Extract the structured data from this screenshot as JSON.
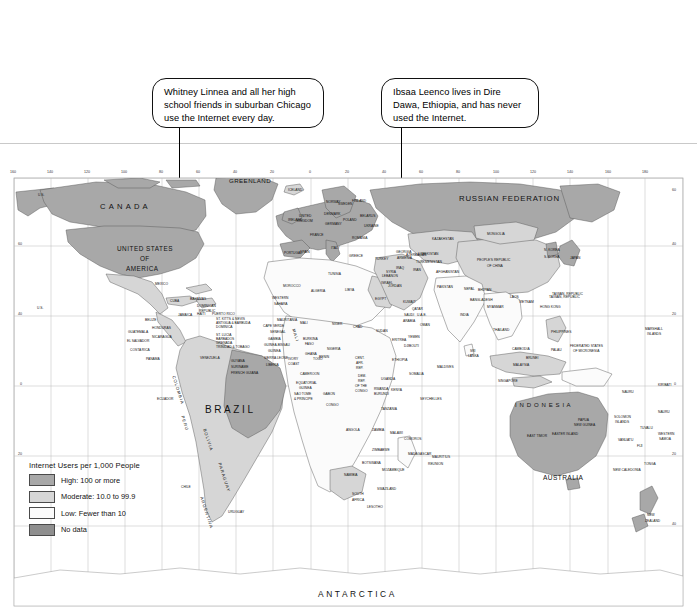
{
  "page": {
    "background_color": "#ffffff"
  },
  "callouts": [
    {
      "id": "callout-usa",
      "text": "Whitney Linnea and all her high school friends in suburban Chicago use the Internet every day.",
      "target": "United States (Chicago)"
    },
    {
      "id": "callout-ethiopia",
      "text": "Ibsaa Leenco lives in Dire Dawa, Ethiopia, and has never used the Internet.",
      "target": "Ethiopia (Dire Dawa)"
    }
  ],
  "legend": {
    "title": "Internet Users per 1,000 People",
    "items": [
      {
        "label": "High: 100 or more",
        "color": "#a8a8a8"
      },
      {
        "label": "Moderate: 10.0 to 99.9",
        "color": "#d6d6d6"
      },
      {
        "label": "Low: Fewer than 10",
        "color": "#fbfbfb"
      },
      {
        "label": "No data",
        "color": "#8f8f8f"
      }
    ]
  },
  "graticule": {
    "longitude_labels": [
      "160",
      "140",
      "120",
      "100",
      "80",
      "60",
      "40",
      "20",
      "0",
      "20",
      "40",
      "60",
      "80",
      "100",
      "120",
      "140",
      "160",
      "180"
    ],
    "latitude_labels_left": [
      "60",
      "40",
      "0",
      "20"
    ],
    "latitude_labels_right": [
      "60",
      "40",
      "20",
      "0",
      "20",
      "40"
    ]
  },
  "map_labels": {
    "continents": [
      {
        "name": "ANTARCTICA",
        "x": 355,
        "y": 594
      }
    ],
    "major": [
      {
        "name": "CANADA",
        "x": 100,
        "y": 205
      },
      {
        "name": "UNITED STATES",
        "x": 117,
        "y": 248
      },
      {
        "name": "OF",
        "x": 140,
        "y": 258
      },
      {
        "name": "AMERICA",
        "x": 126,
        "y": 268
      },
      {
        "name": "BRAZIL",
        "x": 210,
        "y": 409
      },
      {
        "name": "RUSSIAN  FEDERATION",
        "x": 470,
        "y": 198
      },
      {
        "name": "AUSTRALIA",
        "x": 551,
        "y": 477
      },
      {
        "name": "GREENLAND",
        "x": 232,
        "y": 180
      },
      {
        "name": "I N D O N E S I A",
        "x": 524,
        "y": 406
      }
    ],
    "countries": [
      {
        "name": "U.S.",
        "x": 38,
        "y": 193
      },
      {
        "name": "U.S.",
        "x": 37,
        "y": 306
      },
      {
        "name": "ICELAND",
        "x": 288,
        "y": 188
      },
      {
        "name": "MEXICO",
        "x": 155,
        "y": 282
      },
      {
        "name": "CUBA",
        "x": 170,
        "y": 299
      },
      {
        "name": "BAHAMAS",
        "x": 190,
        "y": 297
      },
      {
        "name": "BELIZE",
        "x": 145,
        "y": 318
      },
      {
        "name": "JAMAICA",
        "x": 178,
        "y": 313
      },
      {
        "name": "HAITI",
        "x": 197,
        "y": 312
      },
      {
        "name": "DOMINICAN",
        "x": 197,
        "y": 304
      },
      {
        "name": "REPUBLIC",
        "x": 199,
        "y": 309
      },
      {
        "name": "PUERTO RICO",
        "x": 212,
        "y": 312
      },
      {
        "name": "ST. KITTS & NEVIS",
        "x": 216,
        "y": 317
      },
      {
        "name": "ANTIGUA & BARBUDA",
        "x": 216,
        "y": 321
      },
      {
        "name": "DOMINICA",
        "x": 216,
        "y": 325
      },
      {
        "name": "ST. LUCIA",
        "x": 216,
        "y": 333
      },
      {
        "name": "BARBADOS",
        "x": 216,
        "y": 337
      },
      {
        "name": "GRENADA",
        "x": 216,
        "y": 341
      },
      {
        "name": "TRINIDAD & TOBAGO",
        "x": 216,
        "y": 345
      },
      {
        "name": "GUATEMALA",
        "x": 128,
        "y": 330
      },
      {
        "name": "HONDURAS",
        "x": 152,
        "y": 326
      },
      {
        "name": "EL SALVADOR",
        "x": 127,
        "y": 339
      },
      {
        "name": "NICARAGUA",
        "x": 152,
        "y": 335
      },
      {
        "name": "COSTA RICA",
        "x": 130,
        "y": 348
      },
      {
        "name": "PANAMA",
        "x": 146,
        "y": 357
      },
      {
        "name": "VENEZUELA",
        "x": 200,
        "y": 356
      },
      {
        "name": "GUYANA",
        "x": 231,
        "y": 359
      },
      {
        "name": "SURINAME",
        "x": 231,
        "y": 365
      },
      {
        "name": "FRENCH GUIANA",
        "x": 231,
        "y": 371
      },
      {
        "name": "ECUADOR",
        "x": 157,
        "y": 397
      },
      {
        "name": "CHILE",
        "x": 181,
        "y": 485
      },
      {
        "name": "URUGUAY",
        "x": 228,
        "y": 510
      },
      {
        "name": "PORTUGAL",
        "x": 284,
        "y": 251
      },
      {
        "name": "SPAIN",
        "x": 300,
        "y": 250
      },
      {
        "name": "ALGERIA",
        "x": 311,
        "y": 289
      },
      {
        "name": "LIBYA",
        "x": 345,
        "y": 288
      },
      {
        "name": "EGYPT",
        "x": 375,
        "y": 297
      },
      {
        "name": "TURKEY",
        "x": 375,
        "y": 257
      },
      {
        "name": "IRAN",
        "x": 413,
        "y": 268
      },
      {
        "name": "IRAQ",
        "x": 396,
        "y": 266
      },
      {
        "name": "SAUDI",
        "x": 404,
        "y": 313
      },
      {
        "name": "ARABIA",
        "x": 403,
        "y": 319
      },
      {
        "name": "WESTERN",
        "x": 272,
        "y": 296
      },
      {
        "name": "SAHARA",
        "x": 274,
        "y": 302
      },
      {
        "name": "MAURITANIA",
        "x": 277,
        "y": 318
      },
      {
        "name": "SENEGAL",
        "x": 270,
        "y": 330
      },
      {
        "name": "GAMBIA",
        "x": 268,
        "y": 337
      },
      {
        "name": "CAPE VERDE",
        "x": 263,
        "y": 324
      },
      {
        "name": "GUINEA-BISSAU",
        "x": 264,
        "y": 343
      },
      {
        "name": "GUINEA",
        "x": 268,
        "y": 349
      },
      {
        "name": "SIERRA LEONE",
        "x": 264,
        "y": 356
      },
      {
        "name": "LIBERIA",
        "x": 266,
        "y": 363
      },
      {
        "name": "MALI",
        "x": 300,
        "y": 321
      },
      {
        "name": "NIGER",
        "x": 332,
        "y": 322
      },
      {
        "name": "CHAD",
        "x": 353,
        "y": 325
      },
      {
        "name": "SUDAN",
        "x": 376,
        "y": 329
      },
      {
        "name": "ERITREA",
        "x": 392,
        "y": 338
      },
      {
        "name": "DJIBOUTI",
        "x": 404,
        "y": 344
      },
      {
        "name": "NIGERIA",
        "x": 327,
        "y": 347
      },
      {
        "name": "BURKINA",
        "x": 303,
        "y": 337
      },
      {
        "name": "FASO",
        "x": 305,
        "y": 342
      },
      {
        "name": "GHANA",
        "x": 305,
        "y": 352
      },
      {
        "name": "TOGO",
        "x": 313,
        "y": 357
      },
      {
        "name": "BENIN",
        "x": 319,
        "y": 355
      },
      {
        "name": "IVORY",
        "x": 288,
        "y": 357
      },
      {
        "name": "COAST",
        "x": 288,
        "y": 362
      },
      {
        "name": "CAMEROON",
        "x": 300,
        "y": 372
      },
      {
        "name": "EQUATORIAL",
        "x": 296,
        "y": 381
      },
      {
        "name": "GUINEA",
        "x": 299,
        "y": 386
      },
      {
        "name": "SAO TOME",
        "x": 294,
        "y": 392
      },
      {
        "name": "& PRINCIPE",
        "x": 294,
        "y": 397
      },
      {
        "name": "GABON",
        "x": 323,
        "y": 392
      },
      {
        "name": "CONGO",
        "x": 326,
        "y": 403
      },
      {
        "name": "CENT.",
        "x": 355,
        "y": 356
      },
      {
        "name": "AFR.",
        "x": 356,
        "y": 361
      },
      {
        "name": "REP.",
        "x": 356,
        "y": 366
      },
      {
        "name": "DEM.",
        "x": 358,
        "y": 374
      },
      {
        "name": "REP.",
        "x": 358,
        "y": 379
      },
      {
        "name": "OF THE",
        "x": 355,
        "y": 384
      },
      {
        "name": "CONGO",
        "x": 355,
        "y": 389
      },
      {
        "name": "ETHIOPIA",
        "x": 392,
        "y": 358
      },
      {
        "name": "SOMALIA",
        "x": 409,
        "y": 372
      },
      {
        "name": "UGANDA",
        "x": 381,
        "y": 377
      },
      {
        "name": "KENYA",
        "x": 391,
        "y": 388
      },
      {
        "name": "RWANDA",
        "x": 374,
        "y": 387
      },
      {
        "name": "BURUNDI",
        "x": 374,
        "y": 392
      },
      {
        "name": "TANZANIA",
        "x": 381,
        "y": 407
      },
      {
        "name": "SEYCHELLES",
        "x": 420,
        "y": 397
      },
      {
        "name": "ANGOLA",
        "x": 346,
        "y": 428
      },
      {
        "name": "ZAMBIA",
        "x": 372,
        "y": 428
      },
      {
        "name": "MALAWI",
        "x": 390,
        "y": 431
      },
      {
        "name": "MOZAMBIQUE",
        "x": 382,
        "y": 468
      },
      {
        "name": "ZIMBABWE",
        "x": 372,
        "y": 448
      },
      {
        "name": "BOTSWANA",
        "x": 362,
        "y": 461
      },
      {
        "name": "NAMIBIA",
        "x": 344,
        "y": 473
      },
      {
        "name": "SOUTH",
        "x": 352,
        "y": 492
      },
      {
        "name": "AFRICA",
        "x": 352,
        "y": 498
      },
      {
        "name": "LESOTHO",
        "x": 367,
        "y": 505
      },
      {
        "name": "SWAZILAND",
        "x": 377,
        "y": 487
      },
      {
        "name": "MADAGASCAR",
        "x": 408,
        "y": 452
      },
      {
        "name": "KAZAKHSTAN",
        "x": 432,
        "y": 237
      },
      {
        "name": "MONGOLIA",
        "x": 487,
        "y": 232
      },
      {
        "name": "PEOPLE'S REPUBLIC",
        "x": 477,
        "y": 258
      },
      {
        "name": "OF CHINA",
        "x": 487,
        "y": 264
      },
      {
        "name": "N. KOREA",
        "x": 544,
        "y": 248
      },
      {
        "name": "S. KOREA",
        "x": 544,
        "y": 255
      },
      {
        "name": "JAPAN",
        "x": 570,
        "y": 256
      },
      {
        "name": "INDIA",
        "x": 460,
        "y": 313
      },
      {
        "name": "BANGLADESH",
        "x": 470,
        "y": 298
      },
      {
        "name": "SRI",
        "x": 470,
        "y": 349
      },
      {
        "name": "LANKA",
        "x": 468,
        "y": 354
      },
      {
        "name": "MALDIVES",
        "x": 437,
        "y": 365
      },
      {
        "name": "THAILAND",
        "x": 493,
        "y": 328
      },
      {
        "name": "VIETNAM",
        "x": 519,
        "y": 300
      },
      {
        "name": "LAOS",
        "x": 510,
        "y": 295
      },
      {
        "name": "CAMBODIA",
        "x": 512,
        "y": 347
      },
      {
        "name": "MALAYSIA",
        "x": 513,
        "y": 363
      },
      {
        "name": "BRUNEI",
        "x": 526,
        "y": 356
      },
      {
        "name": "SINGAPORE",
        "x": 498,
        "y": 379
      },
      {
        "name": "PHILIPPINES",
        "x": 551,
        "y": 330
      },
      {
        "name": "HONG KONG",
        "x": 540,
        "y": 305
      },
      {
        "name": "TAIWAN, REPUBLIC",
        "x": 549,
        "y": 295
      },
      {
        "name": "TAIWAN, REPUBLIC",
        "x": 552,
        "y": 292
      },
      {
        "name": "PAPUA",
        "x": 578,
        "y": 418
      },
      {
        "name": "NEW GUINEA",
        "x": 574,
        "y": 423
      },
      {
        "name": "EAST TIMOR",
        "x": 527,
        "y": 434
      },
      {
        "name": "SOLOMON",
        "x": 614,
        "y": 415
      },
      {
        "name": "ISLANDS",
        "x": 615,
        "y": 420
      },
      {
        "name": "VANUATU",
        "x": 618,
        "y": 438
      },
      {
        "name": "FIJI",
        "x": 637,
        "y": 444
      },
      {
        "name": "TUVALU",
        "x": 640,
        "y": 426
      },
      {
        "name": "WESTERN",
        "x": 658,
        "y": 432
      },
      {
        "name": "SAMOA",
        "x": 659,
        "y": 437
      },
      {
        "name": "TONGA",
        "x": 644,
        "y": 462
      },
      {
        "name": "NEW CALEDONIA",
        "x": 613,
        "y": 468
      },
      {
        "name": "NEW",
        "x": 647,
        "y": 513
      },
      {
        "name": "ZEALAND",
        "x": 645,
        "y": 519
      },
      {
        "name": "NAURU",
        "x": 622,
        "y": 390
      },
      {
        "name": "KIRIBATI",
        "x": 658,
        "y": 383
      },
      {
        "name": "FEDERATED STATES",
        "x": 570,
        "y": 344
      },
      {
        "name": "OF MICRONESIA",
        "x": 573,
        "y": 349
      },
      {
        "name": "MARSHALL",
        "x": 645,
        "y": 327
      },
      {
        "name": "ISLANDS",
        "x": 647,
        "y": 332
      },
      {
        "name": "PALAU",
        "x": 551,
        "y": 348
      },
      {
        "name": "NAURU",
        "x": 658,
        "y": 410
      },
      {
        "name": "FRANCE",
        "x": 310,
        "y": 233
      },
      {
        "name": "GERMANY",
        "x": 325,
        "y": 222
      },
      {
        "name": "POLAND",
        "x": 343,
        "y": 218
      },
      {
        "name": "UKRAINE",
        "x": 364,
        "y": 224
      },
      {
        "name": "BELARUS",
        "x": 360,
        "y": 214
      },
      {
        "name": "FINLAND",
        "x": 352,
        "y": 199
      },
      {
        "name": "NORWAY",
        "x": 326,
        "y": 200
      },
      {
        "name": "SWEDEN",
        "x": 338,
        "y": 202
      },
      {
        "name": "DENMARK",
        "x": 324,
        "y": 212
      },
      {
        "name": "ITALY",
        "x": 331,
        "y": 246
      },
      {
        "name": "MOROCCO",
        "x": 283,
        "y": 284
      },
      {
        "name": "TUNISIA",
        "x": 328,
        "y": 272
      },
      {
        "name": "GREECE",
        "x": 349,
        "y": 254
      },
      {
        "name": "ROMANIA",
        "x": 352,
        "y": 236
      },
      {
        "name": "UNITED",
        "x": 299,
        "y": 214
      },
      {
        "name": "KINGDOM",
        "x": 297,
        "y": 219
      },
      {
        "name": "IRELAND",
        "x": 288,
        "y": 218
      },
      {
        "name": "UZBEKISTAN",
        "x": 418,
        "y": 252
      },
      {
        "name": "TURKMENISTAN",
        "x": 416,
        "y": 260
      },
      {
        "name": "AFGHANISTAN",
        "x": 436,
        "y": 270
      },
      {
        "name": "PAKISTAN",
        "x": 437,
        "y": 285
      },
      {
        "name": "NEPAL",
        "x": 464,
        "y": 287
      },
      {
        "name": "BHUTAN",
        "x": 478,
        "y": 288
      },
      {
        "name": "MYANMAR",
        "x": 487,
        "y": 305
      },
      {
        "name": "YEMEN",
        "x": 408,
        "y": 335
      },
      {
        "name": "OMAN",
        "x": 420,
        "y": 323
      },
      {
        "name": "U.A.E.",
        "x": 417,
        "y": 313
      },
      {
        "name": "QATAR",
        "x": 412,
        "y": 307
      },
      {
        "name": "KUWAIT",
        "x": 403,
        "y": 300
      },
      {
        "name": "SYRIA",
        "x": 386,
        "y": 270
      },
      {
        "name": "ISRAEL",
        "x": 381,
        "y": 281
      },
      {
        "name": "JORDAN",
        "x": 388,
        "y": 284
      },
      {
        "name": "LEBANON",
        "x": 382,
        "y": 274
      },
      {
        "name": "GEORGIA",
        "x": 396,
        "y": 250
      },
      {
        "name": "ARMENIA",
        "x": 397,
        "y": 256
      },
      {
        "name": "AZERBAIJAN",
        "x": 406,
        "y": 253
      },
      {
        "name": "COMOROS",
        "x": 404,
        "y": 437
      },
      {
        "name": "MAURITIUS",
        "x": 432,
        "y": 455
      },
      {
        "name": "REUNION",
        "x": 428,
        "y": 462
      },
      {
        "name": "EASTER ISLAND",
        "x": 552,
        "y": 432
      }
    ],
    "rotated": [
      {
        "name": "COLOMBIA",
        "x": 176,
        "y": 375
      },
      {
        "name": "PERU",
        "x": 185,
        "y": 415
      },
      {
        "name": "BOLIVIA",
        "x": 207,
        "y": 428
      },
      {
        "name": "PARAGUAY",
        "x": 222,
        "y": 462
      },
      {
        "name": "ARGENTINA",
        "x": 204,
        "y": 496
      },
      {
        "name": "MALI",
        "x": 296,
        "y": 328
      }
    ]
  }
}
